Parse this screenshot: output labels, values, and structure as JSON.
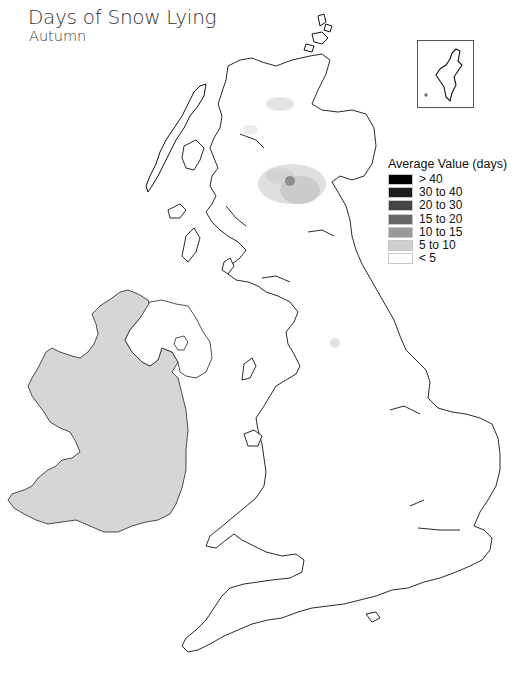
{
  "header": {
    "title": "Days of Snow Lying",
    "subtitle": "Autumn"
  },
  "legend": {
    "title": "Average Value (days)",
    "items": [
      {
        "label": "> 40",
        "color": "#000000"
      },
      {
        "label": "30 to 40",
        "color": "#1c1c1c"
      },
      {
        "label": "20 to 30",
        "color": "#444444"
      },
      {
        "label": "15 to 20",
        "color": "#676767"
      },
      {
        "label": "10 to 15",
        "color": "#9a9a9a"
      },
      {
        "label": "5 to 10",
        "color": "#cfcfcf"
      },
      {
        "label": "< 5",
        "color": "#ffffff"
      }
    ]
  },
  "map": {
    "colors": {
      "ireland_fill": "#d6d6d6",
      "coastline": "#111111",
      "snow_light": "#dcdcdc",
      "snow_mid": "#cbcbcb",
      "snow_peak": "#8f8f8f"
    },
    "inset_label": "Shetland Islands inset"
  }
}
